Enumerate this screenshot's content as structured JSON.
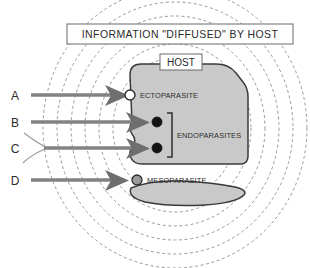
{
  "figure": {
    "title": "INFORMATION \"DIFFUSED\" BY HOST",
    "host_label": "HOST",
    "parasites": {
      "ecto": "ECTOPARASITE",
      "endo": "ENDOPARASITES",
      "meso": "MESOPARASITE"
    },
    "arrows": [
      {
        "id": "A",
        "label": "A"
      },
      {
        "id": "B",
        "label": "B"
      },
      {
        "id": "C",
        "label": "C"
      },
      {
        "id": "D",
        "label": "D"
      }
    ],
    "colors": {
      "body_fill": "#c9c9c9",
      "body_stroke": "#3a3a3a",
      "ring_stroke": "#8d8d8d",
      "arrow_line": "#828282",
      "arrow_head": "#6e6e6e",
      "text": "#2b2b2b",
      "background": "#ffffff",
      "dot_dark": "#141414",
      "dot_gray": "#9a9a9a",
      "dot_white": "#ffffff"
    },
    "ring_count": 6,
    "markers": {
      "ecto_marker": "white-circle",
      "endo_marker_1": "black-circle",
      "endo_marker_2": "black-circle",
      "meso_marker": "gray-circle"
    }
  }
}
